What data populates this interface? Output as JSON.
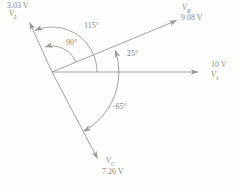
{
  "colors": {
    "line": "#97999b",
    "text": "#8f8983"
  },
  "vectors": {
    "vl": {
      "symbol": "V",
      "sub": "L",
      "value": "3.03 V",
      "magnitude_v": 3.03,
      "angle_deg": 115
    },
    "vr": {
      "symbol": "V",
      "sub": "R",
      "value": "9.08 V",
      "magnitude_v": 9.08,
      "angle_deg": 25
    },
    "vs": {
      "symbol": "V",
      "sub": "s",
      "value": "10 V",
      "magnitude_v": 10,
      "angle_deg": 0
    },
    "vc": {
      "symbol": "V",
      "sub": "C",
      "value": "7.26 V",
      "magnitude_v": 7.26,
      "angle_deg": -65
    }
  },
  "angles": {
    "axis_to_vl": "115°",
    "vr_to_vl": "90°",
    "axis_to_vr": "25°",
    "axis_to_vc": "−65°"
  }
}
